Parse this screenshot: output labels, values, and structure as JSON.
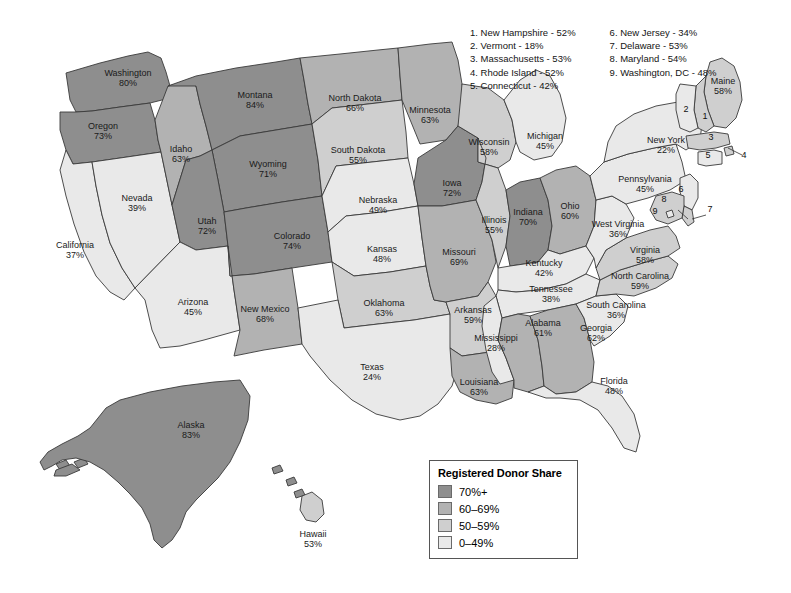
{
  "map": {
    "title": "Registered Donor Share by US State",
    "legend": {
      "title": "Registered Donor Share",
      "items": [
        {
          "label": "70%+",
          "color": "#8e8e8e"
        },
        {
          "label": "60–69%",
          "color": "#b2b2b2"
        },
        {
          "label": "50–59%",
          "color": "#cfcfcf"
        },
        {
          "label": "0–49%",
          "color": "#e9e9e9"
        }
      ]
    },
    "numbered_key": {
      "column1": [
        "1. New Hampshire - 52%",
        "2. Vermont - 18%",
        "3. Massachusetts - 53%",
        "4. Rhode Island - 52%",
        "5. Connecticut - 42%"
      ],
      "column2": [
        "6. New Jersey - 34%",
        "7. Delaware - 53%",
        "8. Maryland - 54%",
        "9. Washington, DC - 48%"
      ]
    },
    "callout_numbers": [
      "1",
      "2",
      "3",
      "4",
      "5",
      "6",
      "7",
      "8",
      "9"
    ]
  },
  "chart_data": {
    "type": "map",
    "title": "Registered Donor Share",
    "value_unit": "percent",
    "bins": [
      {
        "label": "70%+",
        "min": 70,
        "max": 100,
        "color": "#8e8e8e"
      },
      {
        "label": "60–69%",
        "min": 60,
        "max": 69,
        "color": "#b2b2b2"
      },
      {
        "label": "50–59%",
        "min": 50,
        "max": 59,
        "color": "#cfcfcf"
      },
      {
        "label": "0–49%",
        "min": 0,
        "max": 49,
        "color": "#e9e9e9"
      }
    ],
    "states": [
      {
        "code": "WA",
        "name": "Washington",
        "value": 80,
        "label": "Washington",
        "value_text": "80%",
        "bin": 0
      },
      {
        "code": "OR",
        "name": "Oregon",
        "value": 73,
        "label": "Oregon",
        "value_text": "73%",
        "bin": 0
      },
      {
        "code": "CA",
        "name": "California",
        "value": 37,
        "label": "California",
        "value_text": "37%",
        "bin": 3
      },
      {
        "code": "NV",
        "name": "Nevada",
        "value": 39,
        "label": "Nevada",
        "value_text": "39%",
        "bin": 3
      },
      {
        "code": "ID",
        "name": "Idaho",
        "value": 63,
        "label": "Idaho",
        "value_text": "63%",
        "bin": 1
      },
      {
        "code": "MT",
        "name": "Montana",
        "value": 84,
        "label": "Montana",
        "value_text": "84%",
        "bin": 0
      },
      {
        "code": "WY",
        "name": "Wyoming",
        "value": 71,
        "label": "Wyoming",
        "value_text": "71%",
        "bin": 0
      },
      {
        "code": "UT",
        "name": "Utah",
        "value": 72,
        "label": "Utah",
        "value_text": "72%",
        "bin": 0
      },
      {
        "code": "AZ",
        "name": "Arizona",
        "value": 45,
        "label": "Arizona",
        "value_text": "45%",
        "bin": 3
      },
      {
        "code": "CO",
        "name": "Colorado",
        "value": 74,
        "label": "Colorado",
        "value_text": "74%",
        "bin": 0
      },
      {
        "code": "NM",
        "name": "New Mexico",
        "value": 68,
        "label": "New Mexico",
        "value_text": "68%",
        "bin": 1
      },
      {
        "code": "ND",
        "name": "North Dakota",
        "value": 66,
        "label": "North Dakota",
        "value_text": "66%",
        "bin": 1
      },
      {
        "code": "SD",
        "name": "South Dakota",
        "value": 55,
        "label": "South Dakota",
        "value_text": "55%",
        "bin": 2
      },
      {
        "code": "NE",
        "name": "Nebraska",
        "value": 49,
        "label": "Nebraska",
        "value_text": "49%",
        "bin": 3
      },
      {
        "code": "KS",
        "name": "Kansas",
        "value": 48,
        "label": "Kansas",
        "value_text": "48%",
        "bin": 3
      },
      {
        "code": "OK",
        "name": "Oklahoma",
        "value": 63,
        "label": "Oklahoma",
        "value_text": "63%",
        "bin": 2
      },
      {
        "code": "TX",
        "name": "Texas",
        "value": 24,
        "label": "Texas",
        "value_text": "24%",
        "bin": 3
      },
      {
        "code": "MN",
        "name": "Minnesota",
        "value": 63,
        "label": "Minnesota",
        "value_text": "63%",
        "bin": 1
      },
      {
        "code": "IA",
        "name": "Iowa",
        "value": 72,
        "label": "Iowa",
        "value_text": "72%",
        "bin": 0
      },
      {
        "code": "MO",
        "name": "Missouri",
        "value": 69,
        "label": "Missouri",
        "value_text": "69%",
        "bin": 1
      },
      {
        "code": "AR",
        "name": "Arkansas",
        "value": 59,
        "label": "Arkansas",
        "value_text": "59%",
        "bin": 2
      },
      {
        "code": "LA",
        "name": "Louisiana",
        "value": 63,
        "label": "Louisiana",
        "value_text": "63%",
        "bin": 1
      },
      {
        "code": "WI",
        "name": "Wisconsin",
        "value": 58,
        "label": "Wisconsin",
        "value_text": "58%",
        "bin": 2
      },
      {
        "code": "IL",
        "name": "Illinois",
        "value": 55,
        "label": "Illinois",
        "value_text": "55%",
        "bin": 2
      },
      {
        "code": "MI",
        "name": "Michigan",
        "value": 45,
        "label": "Michigan",
        "value_text": "45%",
        "bin": 3
      },
      {
        "code": "IN",
        "name": "Indiana",
        "value": 70,
        "label": "Indiana",
        "value_text": "70%",
        "bin": 0
      },
      {
        "code": "OH",
        "name": "Ohio",
        "value": 60,
        "label": "Ohio",
        "value_text": "60%",
        "bin": 1
      },
      {
        "code": "KY",
        "name": "Kentucky",
        "value": 42,
        "label": "Kentucky",
        "value_text": "42%",
        "bin": 3
      },
      {
        "code": "TN",
        "name": "Tennessee",
        "value": 38,
        "label": "Tennessee",
        "value_text": "38%",
        "bin": 3
      },
      {
        "code": "MS",
        "name": "Mississippi",
        "value": 28,
        "label": "Mississippi",
        "value_text": "28%",
        "bin": 3
      },
      {
        "code": "AL",
        "name": "Alabama",
        "value": 61,
        "label": "Alabama",
        "value_text": "61%",
        "bin": 1
      },
      {
        "code": "GA",
        "name": "Georgia",
        "value": 62,
        "label": "Georgia",
        "value_text": "62%",
        "bin": 1
      },
      {
        "code": "FL",
        "name": "Florida",
        "value": 48,
        "label": "Florida",
        "value_text": "48%",
        "bin": 3
      },
      {
        "code": "SC",
        "name": "South Carolina",
        "value": 36,
        "label": "South Carolina",
        "value_text": "36%",
        "bin": 3
      },
      {
        "code": "NC",
        "name": "North Carolina",
        "value": 59,
        "label": "North Carolina",
        "value_text": "59%",
        "bin": 2
      },
      {
        "code": "VA",
        "name": "Virginia",
        "value": 58,
        "label": "Virginia",
        "value_text": "58%",
        "bin": 2
      },
      {
        "code": "WV",
        "name": "West Virginia",
        "value": 36,
        "label": "West Virginia",
        "value_text": "36%",
        "bin": 3
      },
      {
        "code": "PA",
        "name": "Pennsylvania",
        "value": 45,
        "label": "Pennsylvania",
        "value_text": "45%",
        "bin": 3
      },
      {
        "code": "NY",
        "name": "New York",
        "value": 22,
        "label": "New York",
        "value_text": "22%",
        "bin": 3
      },
      {
        "code": "ME",
        "name": "Maine",
        "value": 58,
        "label": "Maine",
        "value_text": "58%",
        "bin": 2
      },
      {
        "code": "NH",
        "name": "New Hampshire",
        "value": 52,
        "label": "1",
        "value_text": "",
        "bin": 2
      },
      {
        "code": "VT",
        "name": "Vermont",
        "value": 18,
        "label": "2",
        "value_text": "",
        "bin": 3
      },
      {
        "code": "MA",
        "name": "Massachusetts",
        "value": 53,
        "label": "3",
        "value_text": "",
        "bin": 2
      },
      {
        "code": "RI",
        "name": "Rhode Island",
        "value": 52,
        "label": "4",
        "value_text": "",
        "bin": 2
      },
      {
        "code": "CT",
        "name": "Connecticut",
        "value": 42,
        "label": "5",
        "value_text": "",
        "bin": 3
      },
      {
        "code": "NJ",
        "name": "New Jersey",
        "value": 34,
        "label": "6",
        "value_text": "",
        "bin": 3
      },
      {
        "code": "DE",
        "name": "Delaware",
        "value": 53,
        "label": "7",
        "value_text": "",
        "bin": 2
      },
      {
        "code": "MD",
        "name": "Maryland",
        "value": 54,
        "label": "8",
        "value_text": "",
        "bin": 2
      },
      {
        "code": "DC",
        "name": "Washington, DC",
        "value": 48,
        "label": "9",
        "value_text": "",
        "bin": 3
      },
      {
        "code": "AK",
        "name": "Alaska",
        "value": 83,
        "label": "Alaska",
        "value_text": "83%",
        "bin": 0
      },
      {
        "code": "HI",
        "name": "Hawaii",
        "value": 53,
        "label": "Hawaii",
        "value_text": "53%",
        "bin": 2
      }
    ]
  }
}
